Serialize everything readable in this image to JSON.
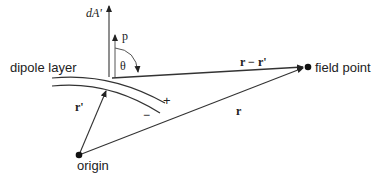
{
  "diagram": {
    "labels": {
      "dA": "dA'",
      "p": "p",
      "theta": "θ",
      "dipole_layer": "dipole layer",
      "r_minus_rprime": "r − r'",
      "field_point": "field point",
      "rprime": "r'",
      "r": "r",
      "origin": "origin",
      "plus": "+",
      "minus": "−"
    },
    "colors": {
      "stroke": "#222222",
      "background": "#ffffff"
    }
  }
}
